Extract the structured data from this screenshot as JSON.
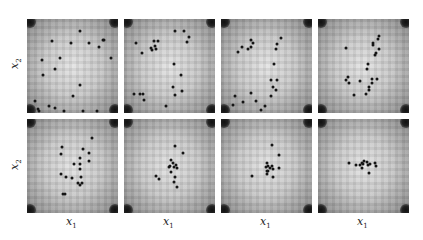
{
  "chart_data": {
    "type": "scatter",
    "title": "",
    "layout": {
      "rows": 2,
      "cols": 4,
      "grid": false,
      "legend": false
    },
    "xlabel": "x1",
    "ylabel": "x2",
    "coordinate_note": "normalized panel coords, x in [0,1] left-to-right, y in [0,1] top-to-bottom",
    "panels": [
      {
        "row": 0,
        "col": 0,
        "points": [
          [
            0.58,
            0.13
          ],
          [
            0.28,
            0.23
          ],
          [
            0.48,
            0.25
          ],
          [
            0.68,
            0.25
          ],
          [
            0.79,
            0.3
          ],
          [
            0.85,
            0.22
          ],
          [
            0.83,
            0.22
          ],
          [
            0.16,
            0.44
          ],
          [
            0.36,
            0.42
          ],
          [
            0.31,
            0.53
          ],
          [
            0.18,
            0.6
          ],
          [
            0.92,
            0.41
          ],
          [
            0.58,
            0.7
          ],
          [
            0.09,
            0.87
          ],
          [
            0.12,
            0.96
          ],
          [
            0.24,
            0.93
          ],
          [
            0.31,
            0.95
          ],
          [
            0.13,
            0.99
          ],
          [
            0.41,
            1.05
          ],
          [
            0.61,
            1.07
          ],
          [
            0.5,
            0.82
          ],
          [
            0.77,
            1.1
          ]
        ]
      },
      {
        "row": 0,
        "col": 1,
        "points": [
          [
            0.56,
            0.13
          ],
          [
            0.66,
            0.13
          ],
          [
            0.71,
            0.19
          ],
          [
            0.69,
            0.24
          ],
          [
            0.33,
            0.23
          ],
          [
            0.37,
            0.23
          ],
          [
            0.34,
            0.29
          ],
          [
            0.31,
            0.33
          ],
          [
            0.3,
            0.31
          ],
          [
            0.35,
            0.32
          ],
          [
            0.13,
            0.26
          ],
          [
            0.2,
            0.36
          ],
          [
            0.55,
            0.48
          ],
          [
            0.63,
            0.6
          ],
          [
            0.64,
            0.77
          ],
          [
            0.54,
            0.72
          ],
          [
            0.56,
            0.81
          ],
          [
            0.11,
            0.8
          ],
          [
            0.18,
            0.8
          ],
          [
            0.21,
            0.8
          ],
          [
            0.22,
            0.86
          ],
          [
            0.46,
            0.93
          ]
        ]
      },
      {
        "row": 0,
        "col": 2,
        "points": [
          [
            0.66,
            0.2
          ],
          [
            0.62,
            0.27
          ],
          [
            0.6,
            0.32
          ],
          [
            0.33,
            0.22
          ],
          [
            0.35,
            0.26
          ],
          [
            0.23,
            0.3
          ],
          [
            0.33,
            0.3
          ],
          [
            0.3,
            0.32
          ],
          [
            0.19,
            0.35
          ],
          [
            0.58,
            0.48
          ],
          [
            0.55,
            0.65
          ],
          [
            0.62,
            0.65
          ],
          [
            0.57,
            0.72
          ],
          [
            0.55,
            0.82
          ],
          [
            0.6,
            0.76
          ],
          [
            0.33,
            0.79
          ],
          [
            0.24,
            0.88
          ],
          [
            0.15,
            0.82
          ],
          [
            0.39,
            0.87
          ],
          [
            0.44,
            0.97
          ],
          [
            0.48,
            0.93
          ],
          [
            0.13,
            0.91
          ]
        ]
      },
      {
        "row": 0,
        "col": 3,
        "points": [
          [
            0.66,
            0.21
          ],
          [
            0.67,
            0.18
          ],
          [
            0.6,
            0.25
          ],
          [
            0.6,
            0.28
          ],
          [
            0.67,
            0.32
          ],
          [
            0.64,
            0.36
          ],
          [
            0.63,
            0.38
          ],
          [
            0.31,
            0.31
          ],
          [
            0.55,
            0.48
          ],
          [
            0.54,
            0.53
          ],
          [
            0.59,
            0.64
          ],
          [
            0.65,
            0.64
          ],
          [
            0.59,
            0.68
          ],
          [
            0.56,
            0.72
          ],
          [
            0.56,
            0.76
          ],
          [
            0.53,
            0.8
          ],
          [
            0.33,
            0.62
          ],
          [
            0.31,
            0.65
          ],
          [
            0.34,
            0.68
          ],
          [
            0.46,
            0.66
          ],
          [
            0.4,
            0.81
          ]
        ]
      },
      {
        "row": 1,
        "col": 0,
        "points": [
          [
            0.71,
            0.2
          ],
          [
            0.38,
            0.3
          ],
          [
            0.37,
            0.37
          ],
          [
            0.61,
            0.32
          ],
          [
            0.68,
            0.36
          ],
          [
            0.68,
            0.45
          ],
          [
            0.58,
            0.42
          ],
          [
            0.58,
            0.48
          ],
          [
            0.52,
            0.48
          ],
          [
            0.58,
            0.53
          ],
          [
            0.37,
            0.58
          ],
          [
            0.43,
            0.62
          ],
          [
            0.49,
            0.63
          ],
          [
            0.59,
            0.62
          ],
          [
            0.56,
            0.68
          ],
          [
            0.6,
            0.68
          ],
          [
            0.58,
            0.7
          ],
          [
            0.42,
            0.8
          ],
          [
            0.4,
            0.8
          ]
        ]
      },
      {
        "row": 1,
        "col": 1,
        "points": [
          [
            0.56,
            0.29
          ],
          [
            0.65,
            0.36
          ],
          [
            0.52,
            0.44
          ],
          [
            0.54,
            0.47
          ],
          [
            0.5,
            0.5
          ],
          [
            0.55,
            0.51
          ],
          [
            0.57,
            0.49
          ],
          [
            0.58,
            0.52
          ],
          [
            0.49,
            0.51
          ],
          [
            0.52,
            0.56
          ],
          [
            0.56,
            0.62
          ],
          [
            0.35,
            0.61
          ],
          [
            0.39,
            0.64
          ],
          [
            0.55,
            0.67
          ],
          [
            0.58,
            0.72
          ]
        ]
      },
      {
        "row": 1,
        "col": 2,
        "points": [
          [
            0.56,
            0.28
          ],
          [
            0.64,
            0.38
          ],
          [
            0.5,
            0.47
          ],
          [
            0.52,
            0.5
          ],
          [
            0.49,
            0.51
          ],
          [
            0.56,
            0.5
          ],
          [
            0.54,
            0.52
          ],
          [
            0.52,
            0.55
          ],
          [
            0.57,
            0.53
          ],
          [
            0.5,
            0.55
          ],
          [
            0.64,
            0.52
          ],
          [
            0.57,
            0.62
          ],
          [
            0.34,
            0.61
          ],
          [
            0.5,
            0.59
          ]
        ]
      },
      {
        "row": 1,
        "col": 3,
        "points": [
          [
            0.34,
            0.47
          ],
          [
            0.42,
            0.49
          ],
          [
            0.46,
            0.49
          ],
          [
            0.48,
            0.47
          ],
          [
            0.5,
            0.45
          ],
          [
            0.49,
            0.48
          ],
          [
            0.54,
            0.46
          ],
          [
            0.55,
            0.49
          ],
          [
            0.57,
            0.48
          ],
          [
            0.63,
            0.47
          ],
          [
            0.64,
            0.5
          ],
          [
            0.48,
            0.52
          ],
          [
            0.56,
            0.57
          ]
        ]
      }
    ]
  },
  "labels": {
    "x": "x",
    "x_sub": "1",
    "y": "x",
    "y_sub": "2"
  }
}
